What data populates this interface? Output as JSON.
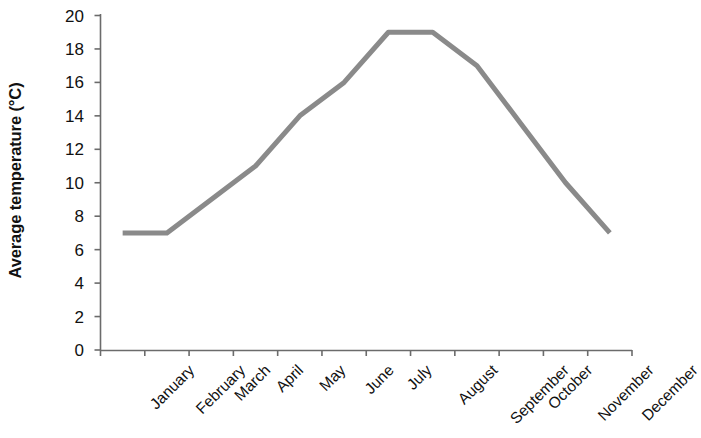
{
  "chart_data": {
    "type": "line",
    "title": "",
    "subtitle": "",
    "xlabel": "",
    "ylabel": "Average temperature (°C)",
    "categories": [
      "January",
      "February",
      "March",
      "April",
      "May",
      "June",
      "July",
      "August",
      "September",
      "October",
      "November",
      "December"
    ],
    "values": [
      7,
      7,
      9,
      11,
      14,
      16,
      19,
      19,
      17,
      13.5,
      10,
      7
    ],
    "series": [
      {
        "name": "Average temperature",
        "values": [
          7,
          7,
          9,
          11,
          14,
          16,
          19,
          19,
          17,
          13.5,
          10,
          7
        ],
        "color": "#8a8a8a"
      }
    ],
    "ylim": [
      0,
      20
    ],
    "ytick_values": [
      0,
      2,
      4,
      6,
      8,
      10,
      12,
      14,
      16,
      18,
      20
    ],
    "ytick_labels": [
      "0",
      "2",
      "4",
      "6",
      "8",
      "10",
      "12",
      "14",
      "16",
      "18",
      "20"
    ],
    "grid": false,
    "legend": false,
    "legend_position": "none",
    "markers": false,
    "x_label_rotation": -45,
    "axis_color": "#6b6b6b",
    "text_color": "#111111",
    "background": "#ffffff"
  }
}
